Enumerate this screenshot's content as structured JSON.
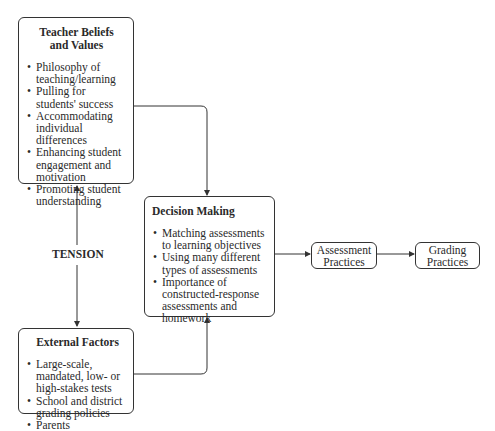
{
  "diagram": {
    "teacher_box": {
      "title_line1": "Teacher Beliefs",
      "title_line2": "and Values",
      "items": [
        "Philosophy of teaching/learning",
        "Pulling for students' success",
        "Accommodating individual differences",
        "Enhancing student engagement and motivation",
        "Promoting student understanding"
      ]
    },
    "tension_label": "TENSION",
    "external_box": {
      "title": "External Factors",
      "items": [
        "Large-scale, mandated, low- or high-stakes tests",
        "School and district grading policies",
        "Parents"
      ]
    },
    "decision_box": {
      "title": "Decision Making",
      "items": [
        "Matching assessments to learning objectives",
        "Using many different types of assessments",
        "Importance of constructed-response assessments and homework"
      ]
    },
    "assessment_box": {
      "line1": "Assessment",
      "line2": "Practices"
    },
    "grading_box": {
      "line1": "Grading",
      "line2": "Practices"
    },
    "colors": {
      "stroke": "#333333",
      "text": "#2a2a2a",
      "background": "#ffffff"
    }
  }
}
